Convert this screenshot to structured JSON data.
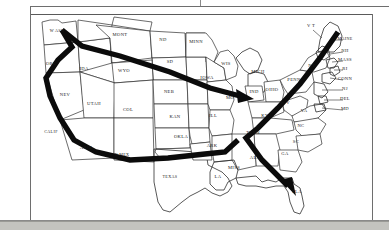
{
  "document": {
    "type": "scanned-map-figure",
    "title": "United States route map",
    "background_color": "#ffffff",
    "page_margin_color": "#c3c3bf",
    "ink_color": "#1a1a1a",
    "route_color": "#0b0b0b"
  },
  "map": {
    "caption": "",
    "state_labels": [
      {
        "id": "wash",
        "text": "W ASH",
        "x": 57,
        "y": 32
      },
      {
        "id": "ore",
        "text": "ORE",
        "x": 51,
        "y": 65
      },
      {
        "id": "ida",
        "text": "IDA",
        "x": 84,
        "y": 70
      },
      {
        "id": "mont",
        "text": "MONT",
        "x": 120,
        "y": 36
      },
      {
        "id": "nd",
        "text": "ND",
        "x": 163,
        "y": 41
      },
      {
        "id": "sd",
        "text": "SD",
        "x": 170,
        "y": 63
      },
      {
        "id": "wyo",
        "text": "WYO",
        "x": 124,
        "y": 72
      },
      {
        "id": "nev",
        "text": "NEV",
        "x": 65,
        "y": 96
      },
      {
        "id": "utah",
        "text": "UTAH",
        "x": 94,
        "y": 105
      },
      {
        "id": "col",
        "text": "COL",
        "x": 128,
        "y": 111
      },
      {
        "id": "neb",
        "text": "NEB",
        "x": 169,
        "y": 93
      },
      {
        "id": "kan",
        "text": "KAN",
        "x": 175,
        "y": 118
      },
      {
        "id": "calif",
        "text": "CALIF",
        "x": 51,
        "y": 133
      },
      {
        "id": "ariz",
        "text": "ARIZ",
        "x": 86,
        "y": 149
      },
      {
        "id": "nmex",
        "text": "N MEX",
        "x": 122,
        "y": 156
      },
      {
        "id": "okla",
        "text": "OKLA",
        "x": 181,
        "y": 138
      },
      {
        "id": "texas",
        "text": "TEXAS",
        "x": 170,
        "y": 178
      },
      {
        "id": "minn",
        "text": "MINN",
        "x": 196,
        "y": 43
      },
      {
        "id": "wis",
        "text": "WIS",
        "x": 226,
        "y": 65
      },
      {
        "id": "iowa",
        "text": "IOWA",
        "x": 207,
        "y": 79
      },
      {
        "id": "mo",
        "text": "MO",
        "x": 230,
        "y": 99
      },
      {
        "id": "ill",
        "text": "ILL",
        "x": 213,
        "y": 117
      },
      {
        "id": "ark",
        "text": "ARK",
        "x": 212,
        "y": 147
      },
      {
        "id": "la",
        "text": "LA",
        "x": 218,
        "y": 178
      },
      {
        "id": "miss",
        "text": "MISS",
        "x": 234,
        "y": 169
      },
      {
        "id": "ala",
        "text": "ALA",
        "x": 255,
        "y": 159
      },
      {
        "id": "mich",
        "text": "MICH",
        "x": 258,
        "y": 73
      },
      {
        "id": "ind",
        "text": "IND",
        "x": 254,
        "y": 93
      },
      {
        "id": "ohio",
        "text": "OHIO",
        "x": 272,
        "y": 91
      },
      {
        "id": "ky",
        "text": "KY",
        "x": 265,
        "y": 117
      },
      {
        "id": "tenn",
        "text": "TENN",
        "x": 253,
        "y": 134
      },
      {
        "id": "ga",
        "text": "GA",
        "x": 285,
        "y": 155
      },
      {
        "id": "fla",
        "text": "FLA",
        "x": 297,
        "y": 193
      },
      {
        "id": "sc",
        "text": "SC",
        "x": 296,
        "y": 143
      },
      {
        "id": "nc",
        "text": "NC",
        "x": 301,
        "y": 127
      },
      {
        "id": "va",
        "text": "VA",
        "x": 304,
        "y": 112
      },
      {
        "id": "wv",
        "text": "W V",
        "x": 285,
        "y": 104
      },
      {
        "id": "penn",
        "text": "PENN",
        "x": 294,
        "y": 81
      },
      {
        "id": "ny",
        "text": "NY",
        "x": 312,
        "y": 67
      },
      {
        "id": "vt",
        "text": "V T",
        "x": 311,
        "y": 27
      },
      {
        "id": "maine",
        "text": "MAINE",
        "x": 345,
        "y": 40
      },
      {
        "id": "nh",
        "text": "NH",
        "x": 345,
        "y": 52
      },
      {
        "id": "mass",
        "text": "MASS",
        "x": 345,
        "y": 61
      },
      {
        "id": "ri",
        "text": "RI",
        "x": 345,
        "y": 70
      },
      {
        "id": "conn",
        "text": "CONN",
        "x": 345,
        "y": 80
      },
      {
        "id": "nj",
        "text": "NJ",
        "x": 345,
        "y": 90
      },
      {
        "id": "del",
        "text": "DEL",
        "x": 345,
        "y": 100
      },
      {
        "id": "md",
        "text": "MD",
        "x": 345,
        "y": 110
      }
    ],
    "routes": [
      {
        "id": "route-northwest-to-midwest",
        "description": "Washington south along coast to California, and Washington east across Montana to Iowa/Indiana arrowhead",
        "has_arrowhead": true,
        "arrowhead_target": "ind"
      },
      {
        "id": "route-california-to-tennessee",
        "description": "California southeast across Arizona and New Mexico then east across Texas to Tennessee",
        "has_arrowhead": false
      },
      {
        "id": "route-newengland-to-florida",
        "description": "Maine southwest through New York and Pennsylvania to Tennessee then southeast to Florida arrowhead",
        "has_arrowhead": true,
        "arrowhead_target": "fla"
      }
    ]
  }
}
